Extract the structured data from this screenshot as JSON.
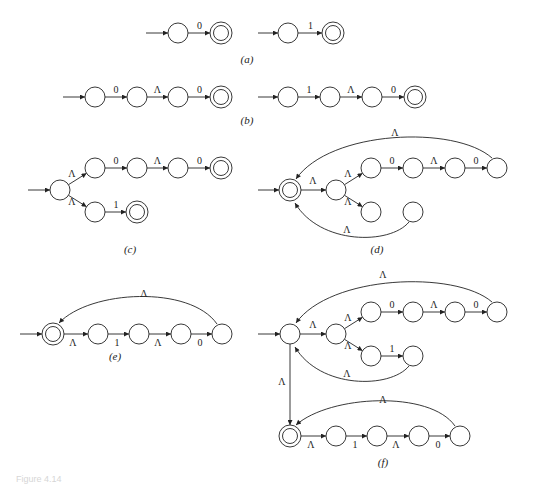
{
  "figure": {
    "caption": "Figure 4.14",
    "stroke_color": "#222222",
    "background": "#ffffff"
  },
  "panels": [
    {
      "id": "a",
      "caption": "(a)",
      "caption_pos": [
        247,
        63
      ],
      "states": [
        {
          "id": "a1",
          "x": 178,
          "y": 33,
          "accept": false
        },
        {
          "id": "a2",
          "x": 221,
          "y": 33,
          "accept": true
        },
        {
          "id": "a3",
          "x": 288,
          "y": 33,
          "accept": false
        },
        {
          "id": "a4",
          "x": 333,
          "y": 33,
          "accept": true
        }
      ],
      "start_arrows": [
        {
          "from": [
            146,
            33
          ],
          "to": "a1"
        },
        {
          "from": [
            258,
            33
          ],
          "to": "a3"
        }
      ],
      "edges": [
        {
          "from": "a1",
          "to": "a2",
          "label": "0"
        },
        {
          "from": "a3",
          "to": "a4",
          "label": "1"
        }
      ]
    },
    {
      "id": "b",
      "caption": "(b)",
      "caption_pos": [
        247,
        124
      ],
      "states": [
        {
          "id": "b1",
          "x": 95,
          "y": 97,
          "accept": false
        },
        {
          "id": "b2",
          "x": 137,
          "y": 97,
          "accept": false
        },
        {
          "id": "b3",
          "x": 178,
          "y": 97,
          "accept": false
        },
        {
          "id": "b4",
          "x": 221,
          "y": 97,
          "accept": true
        },
        {
          "id": "b5",
          "x": 288,
          "y": 97,
          "accept": false
        },
        {
          "id": "b6",
          "x": 330,
          "y": 97,
          "accept": false
        },
        {
          "id": "b7",
          "x": 372,
          "y": 97,
          "accept": false
        },
        {
          "id": "b8",
          "x": 415,
          "y": 97,
          "accept": true
        }
      ],
      "start_arrows": [
        {
          "from": [
            63,
            97
          ],
          "to": "b1"
        },
        {
          "from": [
            258,
            97
          ],
          "to": "b5"
        }
      ],
      "edges": [
        {
          "from": "b1",
          "to": "b2",
          "label": "0"
        },
        {
          "from": "b2",
          "to": "b3",
          "label": "Λ"
        },
        {
          "from": "b3",
          "to": "b4",
          "label": "0"
        },
        {
          "from": "b5",
          "to": "b6",
          "label": "1"
        },
        {
          "from": "b6",
          "to": "b7",
          "label": "Λ"
        },
        {
          "from": "b7",
          "to": "b8",
          "label": "0"
        }
      ]
    },
    {
      "id": "c",
      "caption": "(c)",
      "caption_pos": [
        130,
        253
      ],
      "states": [
        {
          "id": "c0",
          "x": 60,
          "y": 190,
          "accept": false
        },
        {
          "id": "c1",
          "x": 95,
          "y": 168,
          "accept": false
        },
        {
          "id": "c2",
          "x": 137,
          "y": 168,
          "accept": false
        },
        {
          "id": "c3",
          "x": 178,
          "y": 168,
          "accept": false
        },
        {
          "id": "c4",
          "x": 221,
          "y": 168,
          "accept": true
        },
        {
          "id": "c5",
          "x": 95,
          "y": 212,
          "accept": false
        },
        {
          "id": "c6",
          "x": 137,
          "y": 212,
          "accept": true
        }
      ],
      "start_arrows": [
        {
          "from": [
            28,
            190
          ],
          "to": "c0"
        }
      ],
      "edges": [
        {
          "from": "c0",
          "to": "c1",
          "label": "Λ",
          "label_pos": [
            72,
            177
          ]
        },
        {
          "from": "c0",
          "to": "c5",
          "label": "Λ",
          "label_pos": [
            72,
            205
          ]
        },
        {
          "from": "c1",
          "to": "c2",
          "label": "0"
        },
        {
          "from": "c2",
          "to": "c3",
          "label": "Λ"
        },
        {
          "from": "c3",
          "to": "c4",
          "label": "0"
        },
        {
          "from": "c5",
          "to": "c6",
          "label": "1"
        }
      ]
    },
    {
      "id": "d",
      "caption": "(d)",
      "caption_pos": [
        377,
        253
      ],
      "states": [
        {
          "id": "d0",
          "x": 290,
          "y": 190,
          "accept": true
        },
        {
          "id": "d1",
          "x": 336,
          "y": 190,
          "accept": false
        },
        {
          "id": "d2",
          "x": 371,
          "y": 168,
          "accept": false
        },
        {
          "id": "d3",
          "x": 413,
          "y": 168,
          "accept": false
        },
        {
          "id": "d4",
          "x": 455,
          "y": 168,
          "accept": false
        },
        {
          "id": "d5",
          "x": 497,
          "y": 168,
          "accept": false
        },
        {
          "id": "d6",
          "x": 371,
          "y": 212,
          "accept": false
        },
        {
          "id": "d7",
          "x": 413,
          "y": 212,
          "accept": false
        }
      ],
      "start_arrows": [
        {
          "from": [
            258,
            190
          ],
          "to": "d0"
        }
      ],
      "edges": [
        {
          "from": "d0",
          "to": "d1",
          "label": "Λ",
          "label_pos": [
            313,
            184
          ]
        },
        {
          "from": "d1",
          "to": "d2",
          "label": "Λ",
          "label_pos": [
            348,
            177
          ]
        },
        {
          "from": "d1",
          "to": "d6",
          "label": "Λ",
          "label_pos": [
            348,
            205
          ]
        },
        {
          "from": "d2",
          "to": "d3",
          "label": "0"
        },
        {
          "from": "d3",
          "to": "d4",
          "label": "Λ"
        },
        {
          "from": "d4",
          "to": "d5",
          "label": "0"
        }
      ],
      "curves": [
        {
          "path": "M 492,158 C 455,125 330,130 296,179",
          "label": "Λ",
          "label_pos": [
            395,
            136
          ]
        },
        {
          "path": "M 409,222 C 390,245 320,245 295,203",
          "label": "Λ",
          "label_pos": [
            347,
            233
          ]
        }
      ]
    },
    {
      "id": "e",
      "caption": "(e)",
      "caption_pos": [
        115,
        360
      ],
      "states": [
        {
          "id": "e0",
          "x": 53,
          "y": 334,
          "accept": true
        },
        {
          "id": "e1",
          "x": 98,
          "y": 334,
          "accept": false
        },
        {
          "id": "e2",
          "x": 139,
          "y": 334,
          "accept": false
        },
        {
          "id": "e3",
          "x": 181,
          "y": 334,
          "accept": false
        },
        {
          "id": "e4",
          "x": 222,
          "y": 334,
          "accept": false
        }
      ],
      "start_arrows": [
        {
          "from": [
            20,
            334
          ],
          "to": "e0"
        }
      ],
      "edges": [
        {
          "from": "e0",
          "to": "e1",
          "label": "Λ",
          "label_pos": [
            73,
            346
          ]
        },
        {
          "from": "e1",
          "to": "e2",
          "label": "1",
          "label_pos": [
            117,
            346
          ]
        },
        {
          "from": "e2",
          "to": "e3",
          "label": "Λ",
          "label_pos": [
            158,
            346
          ]
        },
        {
          "from": "e3",
          "to": "e4",
          "label": "0",
          "label_pos": [
            200,
            346
          ]
        }
      ],
      "curves": [
        {
          "path": "M 217,324 C 190,285 90,290 59,323",
          "label": "Λ",
          "label_pos": [
            144,
            297
          ]
        }
      ]
    },
    {
      "id": "f",
      "caption": "(f)",
      "caption_pos": [
        383,
        466
      ],
      "states": [
        {
          "id": "f0",
          "x": 290,
          "y": 334,
          "accept": false
        },
        {
          "id": "f1",
          "x": 336,
          "y": 334,
          "accept": false
        },
        {
          "id": "f2",
          "x": 371,
          "y": 312,
          "accept": false
        },
        {
          "id": "f3",
          "x": 413,
          "y": 312,
          "accept": false
        },
        {
          "id": "f4",
          "x": 455,
          "y": 312,
          "accept": false
        },
        {
          "id": "f5",
          "x": 497,
          "y": 312,
          "accept": false
        },
        {
          "id": "f6",
          "x": 371,
          "y": 356,
          "accept": false
        },
        {
          "id": "f7",
          "x": 413,
          "y": 356,
          "accept": false
        },
        {
          "id": "g0",
          "x": 290,
          "y": 436,
          "accept": true
        },
        {
          "id": "g1",
          "x": 336,
          "y": 436,
          "accept": false
        },
        {
          "id": "g2",
          "x": 377,
          "y": 436,
          "accept": false
        },
        {
          "id": "g3",
          "x": 419,
          "y": 436,
          "accept": false
        },
        {
          "id": "g4",
          "x": 460,
          "y": 436,
          "accept": false
        }
      ],
      "start_arrows": [
        {
          "from": [
            258,
            334
          ],
          "to": "f0"
        }
      ],
      "edges": [
        {
          "from": "f0",
          "to": "f1",
          "label": "Λ",
          "label_pos": [
            313,
            328
          ]
        },
        {
          "from": "f1",
          "to": "f2",
          "label": "Λ",
          "label_pos": [
            348,
            321
          ]
        },
        {
          "from": "f1",
          "to": "f6",
          "label": "Λ",
          "label_pos": [
            348,
            349
          ]
        },
        {
          "from": "f2",
          "to": "f3",
          "label": "0"
        },
        {
          "from": "f3",
          "to": "f4",
          "label": "Λ"
        },
        {
          "from": "f4",
          "to": "f5",
          "label": "0"
        },
        {
          "from": "f6",
          "to": "f7",
          "label": "1"
        },
        {
          "from": "f0",
          "to": "g0",
          "label": "Λ",
          "label_pos": [
            282,
            385
          ]
        },
        {
          "from": "g0",
          "to": "g1",
          "label": "Λ",
          "label_pos": [
            311,
            448
          ]
        },
        {
          "from": "g1",
          "to": "g2",
          "label": "1",
          "label_pos": [
            355,
            448
          ]
        },
        {
          "from": "g2",
          "to": "g3",
          "label": "Λ",
          "label_pos": [
            396,
            448
          ]
        },
        {
          "from": "g3",
          "to": "g4",
          "label": "0",
          "label_pos": [
            438,
            448
          ]
        }
      ],
      "curves": [
        {
          "path": "M 492,302 C 455,270 330,275 296,323",
          "label": "Λ",
          "label_pos": [
            383,
            278
          ]
        },
        {
          "path": "M 409,366 C 390,389 320,389 295,347",
          "label": "Λ",
          "label_pos": [
            347,
            377
          ]
        },
        {
          "path": "M 455,426 C 430,390 330,395 296,425",
          "label": "Λ",
          "label_pos": [
            383,
            403
          ]
        }
      ]
    }
  ]
}
